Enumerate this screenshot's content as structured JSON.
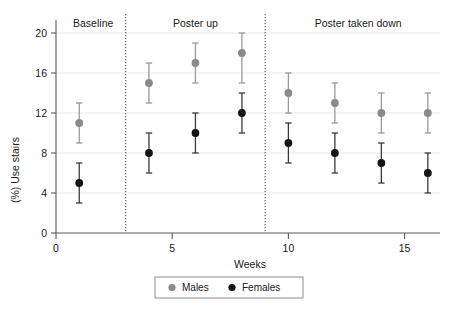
{
  "chart_data": {
    "type": "scatter",
    "title": "",
    "xlabel": "Weeks",
    "ylabel": "(%) Use stairs",
    "xlim": [
      0,
      17
    ],
    "ylim": [
      0,
      21
    ],
    "xticks": [
      0,
      5,
      10,
      15
    ],
    "xticklabels": [
      "0",
      "5",
      "10",
      "15"
    ],
    "yticks": [
      0,
      4,
      8,
      12,
      16,
      20
    ],
    "yticklabels": [
      "0",
      "4",
      "8",
      "12",
      "16",
      "20"
    ],
    "grid": "horizontal",
    "legend_position": "bottom-center",
    "error_bars": "vertical",
    "x": [
      1,
      4,
      6,
      8,
      10,
      12,
      14,
      16
    ],
    "series": [
      {
        "name": "Males",
        "color": "#8a8a8a",
        "values": [
          11,
          15,
          17,
          18,
          14,
          13,
          12,
          12
        ],
        "err_low": [
          9,
          13,
          15,
          15,
          12,
          11,
          10,
          10
        ],
        "err_high": [
          13,
          17,
          19,
          20,
          16,
          15,
          14,
          14
        ]
      },
      {
        "name": "Females",
        "color": "#141414",
        "values": [
          5,
          8,
          10,
          12,
          9,
          8,
          7,
          6
        ],
        "err_low": [
          3,
          6,
          8,
          10,
          7,
          6,
          5,
          4
        ],
        "err_high": [
          7,
          10,
          12,
          14,
          11,
          10,
          9,
          8
        ]
      }
    ],
    "annotations": [
      {
        "label": "Baseline",
        "x_center": 1.6,
        "span": [
          0,
          3
        ]
      },
      {
        "label": "Poster up",
        "x_center": 6.0,
        "span": [
          3,
          9
        ]
      },
      {
        "label": "Poster taken down",
        "x_center": 13.0,
        "span": [
          9,
          17
        ]
      }
    ],
    "phase_dividers": [
      3,
      9
    ],
    "legend": [
      {
        "label": "Males",
        "marker": "circle",
        "color": "#8a8a8a"
      },
      {
        "label": "Females",
        "marker": "circle",
        "color": "#141414"
      }
    ]
  }
}
